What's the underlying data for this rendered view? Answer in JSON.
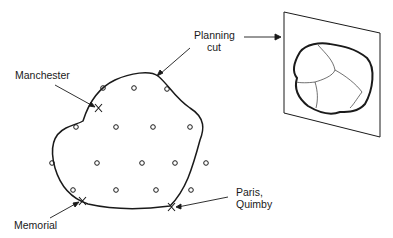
{
  "labels": {
    "planning_cut_line1": "Planning",
    "planning_cut_line2": "cut",
    "manchester": "Manchester",
    "memorial": "Memorial",
    "paris_line1": "Paris,",
    "paris_line2": "Quimby"
  },
  "markers": {
    "circle_symbol": "o",
    "cross_symbol": "X"
  },
  "colors": {
    "stroke": "#1a1a1a",
    "background": "#ffffff"
  }
}
